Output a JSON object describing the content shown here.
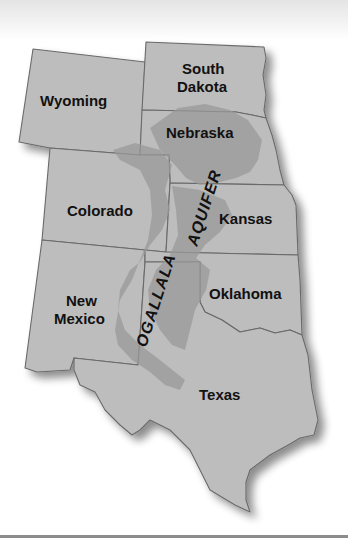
{
  "map": {
    "title": "Ogallala Aquifer",
    "aquifer_label_part1": "OGALLALA",
    "aquifer_label_part2": "AQUIFER",
    "states": [
      {
        "id": "wyoming",
        "name": "Wyoming"
      },
      {
        "id": "south-dakota",
        "name_line1": "South",
        "name_line2": "Dakota"
      },
      {
        "id": "nebraska",
        "name": "Nebraska"
      },
      {
        "id": "colorado",
        "name": "Colorado"
      },
      {
        "id": "kansas",
        "name": "Kansas"
      },
      {
        "id": "new-mexico",
        "name_line1": "New",
        "name_line2": "Mexico"
      },
      {
        "id": "oklahoma",
        "name": "Oklahoma"
      },
      {
        "id": "texas",
        "name": "Texas"
      }
    ],
    "colors": {
      "state_fill": "#bdbdbd",
      "state_border": "#6a6a6a",
      "aquifer_fill": "#9a9a9a",
      "label": "#111111",
      "background": "#ffffff"
    }
  }
}
